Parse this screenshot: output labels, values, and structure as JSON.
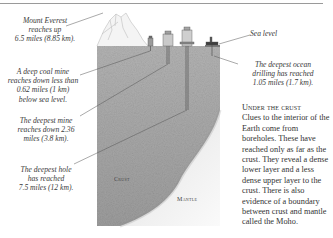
{
  "diagram": {
    "title": "Under the crust",
    "labels": {
      "everest": "Mount Everest reaches up 6.5 miles (8.85 km).",
      "everest_lines": [
        "Mount Everest",
        "reaches up",
        "6.5 miles (8.85 km)."
      ],
      "coal_mine_lines": [
        "A deep coal mine",
        "reaches down less than",
        "0.62 miles (1 km)",
        "below sea level."
      ],
      "deepest_mine_lines": [
        "The deepest mine",
        "reaches down 2.36",
        "miles (3.8 km)."
      ],
      "deepest_hole_lines": [
        "The deepest hole",
        "has reached",
        "7.5 miles (12 km)."
      ],
      "sea_level": "Sea level",
      "ocean_drilling_lines": [
        "The deepest ocean",
        "drilling has reached",
        "1.05 miles (1.7 km)."
      ]
    },
    "layers": {
      "crust": "Crust",
      "mantle": "Mantle"
    },
    "caption": {
      "heading": "Under the crust",
      "body": "Clues to the interior of the Earth come from boreholes. These have reached only as far as the crust. They reveal a dense lower layer and a less dense upper layer to the crust. There is also evidence of a boundary between crust and mantle called the Moho."
    },
    "colors": {
      "crust": "#a9a9a9",
      "mantle": "#f2f2f2",
      "line": "#555555"
    }
  }
}
